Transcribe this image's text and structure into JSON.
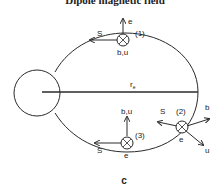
{
  "title": "Dipole magnetic field",
  "caption": "c",
  "colors": {
    "stroke": "#2a2a2a",
    "background": "#ffffff"
  },
  "radius_label": "r",
  "radius_subscript": "e",
  "nodes": [
    {
      "id": "(1)",
      "label": "(1)",
      "vectors": {
        "up": "e",
        "left": "S",
        "into": "b,u"
      }
    },
    {
      "id": "(2)",
      "label": "(2)",
      "vectors": {
        "upper_left": "S",
        "upper_right": "b",
        "lower_right": "u",
        "into": "e"
      }
    },
    {
      "id": "(3)",
      "label": "(3)",
      "vectors": {
        "up": "b,u",
        "left": "S",
        "into": "e"
      }
    }
  ]
}
